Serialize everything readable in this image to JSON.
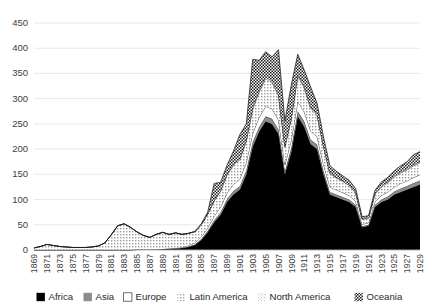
{
  "chart_data": {
    "type": "area",
    "stacked": true,
    "title": "",
    "subtitle": "",
    "xlabel": "",
    "ylabel": "",
    "ylim": [
      0,
      450
    ],
    "ytick_step": 50,
    "yticks": [
      0,
      50,
      100,
      150,
      200,
      250,
      300,
      350,
      400,
      450
    ],
    "grid": true,
    "legend_position": "bottom",
    "x_tick_step": 2,
    "x": [
      1869,
      1870,
      1871,
      1872,
      1873,
      1874,
      1875,
      1876,
      1877,
      1878,
      1879,
      1880,
      1881,
      1882,
      1883,
      1884,
      1885,
      1886,
      1887,
      1888,
      1889,
      1890,
      1891,
      1892,
      1893,
      1894,
      1895,
      1896,
      1897,
      1898,
      1899,
      1900,
      1901,
      1902,
      1903,
      1904,
      1905,
      1906,
      1907,
      1908,
      1909,
      1910,
      1911,
      1912,
      1913,
      1914,
      1915,
      1916,
      1917,
      1918,
      1919,
      1920,
      1921,
      1922,
      1923,
      1924,
      1925,
      1926,
      1927,
      1928,
      1929
    ],
    "xticks": [
      1869,
      1871,
      1873,
      1875,
      1877,
      1879,
      1881,
      1883,
      1885,
      1887,
      1889,
      1891,
      1893,
      1895,
      1897,
      1899,
      1901,
      1903,
      1905,
      1907,
      1909,
      1911,
      1913,
      1915,
      1917,
      1919,
      1921,
      1923,
      1925,
      1927,
      1929
    ],
    "series": [
      {
        "name": "Africa",
        "pattern": "solid-black",
        "color": "#000000",
        "values": [
          0,
          0,
          0,
          0,
          0,
          0,
          0,
          0,
          0,
          0,
          0,
          0,
          0,
          0,
          0,
          0,
          1,
          1,
          1,
          1,
          2,
          2,
          3,
          4,
          6,
          10,
          20,
          35,
          55,
          70,
          95,
          110,
          120,
          150,
          205,
          235,
          255,
          250,
          230,
          150,
          195,
          265,
          245,
          210,
          200,
          150,
          110,
          105,
          100,
          95,
          85,
          45,
          48,
          85,
          95,
          100,
          110,
          115,
          120,
          125,
          130
        ]
      },
      {
        "name": "Asia",
        "pattern": "solid-gray",
        "color": "#8c8c8c",
        "values": [
          0,
          0,
          0,
          0,
          0,
          0,
          0,
          0,
          0,
          0,
          0,
          0,
          0,
          0,
          0,
          0,
          0,
          0,
          0,
          0,
          0,
          0,
          0,
          0,
          1,
          1,
          2,
          3,
          4,
          5,
          6,
          7,
          7,
          8,
          9,
          9,
          10,
          10,
          9,
          6,
          8,
          10,
          10,
          9,
          9,
          7,
          5,
          5,
          5,
          5,
          4,
          2,
          2,
          4,
          5,
          6,
          6,
          7,
          7,
          8,
          8
        ]
      },
      {
        "name": "Europe",
        "pattern": "white-outline",
        "color": "#ffffff",
        "values": [
          0,
          0,
          0,
          0,
          0,
          0,
          0,
          0,
          0,
          0,
          0,
          0,
          0,
          0,
          0,
          0,
          0,
          0,
          0,
          0,
          0,
          1,
          1,
          1,
          2,
          3,
          4,
          6,
          8,
          10,
          12,
          13,
          14,
          16,
          18,
          19,
          20,
          20,
          19,
          13,
          16,
          20,
          19,
          17,
          16,
          13,
          10,
          9,
          9,
          8,
          7,
          4,
          4,
          7,
          8,
          9,
          9,
          10,
          10,
          11,
          11
        ]
      },
      {
        "name": "Latin America",
        "pattern": "light-dots",
        "color": "#f2f2f2",
        "values": [
          4,
          7,
          11,
          9,
          7,
          6,
          5,
          5,
          5,
          6,
          8,
          14,
          30,
          48,
          52,
          45,
          35,
          28,
          24,
          30,
          33,
          28,
          30,
          26,
          24,
          22,
          24,
          27,
          30,
          32,
          36,
          38,
          38,
          42,
          48,
          50,
          55,
          52,
          48,
          35,
          42,
          50,
          48,
          44,
          42,
          34,
          26,
          24,
          22,
          20,
          17,
          10,
          9,
          15,
          17,
          18,
          20,
          21,
          22,
          23,
          24
        ]
      },
      {
        "name": "North America",
        "pattern": "light-hatch",
        "color": "#e3e3e3",
        "values": [
          0,
          0,
          0,
          0,
          0,
          0,
          0,
          0,
          0,
          0,
          0,
          0,
          0,
          0,
          0,
          0,
          0,
          0,
          0,
          0,
          0,
          0,
          0,
          0,
          0,
          0,
          0,
          0,
          1,
          1,
          1,
          2,
          2,
          2,
          3,
          3,
          3,
          3,
          3,
          2,
          2,
          3,
          3,
          3,
          2,
          2,
          2,
          1,
          1,
          1,
          1,
          1,
          1,
          1,
          2,
          2,
          2,
          2,
          2,
          2,
          2
        ]
      },
      {
        "name": "Oceania",
        "pattern": "checker",
        "color": "#d9d9d9",
        "values": [
          0,
          0,
          0,
          0,
          0,
          0,
          0,
          0,
          0,
          0,
          0,
          0,
          0,
          0,
          0,
          0,
          0,
          0,
          0,
          0,
          0,
          0,
          0,
          0,
          0,
          1,
          2,
          4,
          34,
          16,
          18,
          26,
          48,
          32,
          95,
          60,
          50,
          48,
          88,
          50,
          65,
          40,
          32,
          40,
          22,
          18,
          14,
          12,
          10,
          9,
          8,
          4,
          4,
          6,
          8,
          9,
          10,
          12,
          14,
          20,
          20
        ]
      }
    ]
  },
  "legend": {
    "entries": [
      {
        "label": "Africa"
      },
      {
        "label": "Asia"
      },
      {
        "label": "Europe"
      },
      {
        "label": "Latin America"
      },
      {
        "label": "North America"
      },
      {
        "label": "Oceania"
      }
    ]
  }
}
